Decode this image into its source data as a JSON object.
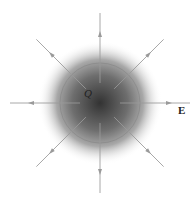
{
  "diagram": {
    "charge_label": "Q",
    "field_label": "E",
    "field_line_count": 8,
    "field_direction": "outward",
    "colors": {
      "sphere_core": "#3a3a3a",
      "glow_edge": "#ffffff",
      "sphere_outline": "#8a8a8a",
      "field_lines": "#9a9a9a",
      "text": "#222222"
    }
  }
}
